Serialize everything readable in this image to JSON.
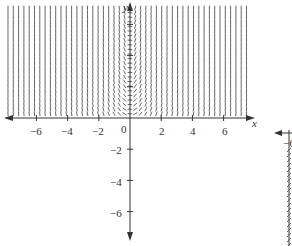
{
  "figure": {
    "type": "slope_field",
    "x_axis": {
      "label": "x",
      "ticks": [
        -6,
        -4,
        -2,
        0,
        2,
        4,
        6
      ],
      "tick_labels": [
        "−6",
        "−4",
        "−2",
        "0",
        "2",
        "4",
        "6"
      ]
    },
    "y_axis": {
      "label": "y",
      "ticks": [
        6,
        4,
        2,
        -2,
        -4,
        -6
      ],
      "tick_labels": [
        "6",
        "4",
        "2",
        "−2",
        "−4",
        "−6"
      ]
    },
    "field_region": {
      "x_range": [
        -7.5,
        7.5
      ],
      "y_range": [
        0,
        7
      ]
    },
    "partial_second_plot": {
      "visible_label": "−6",
      "note": "cropped second axes at right edge"
    }
  },
  "colors": {
    "axis": "#333333",
    "segments": "#555555",
    "background": "#ffffff"
  }
}
